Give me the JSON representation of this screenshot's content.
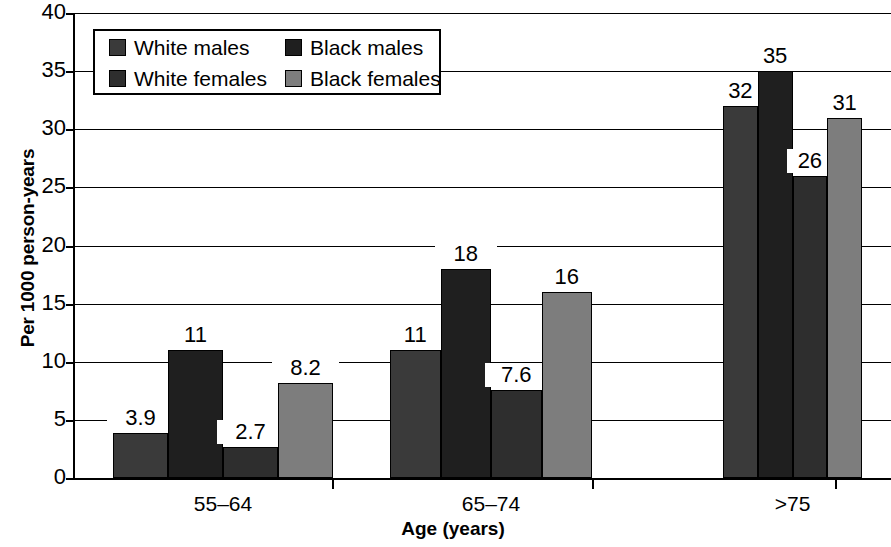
{
  "chart_data": {
    "type": "bar",
    "title": "",
    "subtitle": "",
    "xlabel": "Age (years)",
    "ylabel": "Per 1000 person-years",
    "categories": [
      "55–64",
      "65–74",
      ">75"
    ],
    "series": [
      {
        "name": "White males",
        "color": "#3a3a3a",
        "values": [
          3.9,
          11,
          32
        ],
        "labels": [
          "3.9",
          "11",
          "32"
        ]
      },
      {
        "name": "Black males",
        "color": "#1f1f1f",
        "values": [
          11,
          18,
          35
        ],
        "labels": [
          "11",
          "18",
          "35"
        ]
      },
      {
        "name": "White females",
        "color": "#2e2e2e",
        "values": [
          2.7,
          7.6,
          26
        ],
        "labels": [
          "2.7",
          "7.6",
          "26"
        ]
      },
      {
        "name": "Black females",
        "color": "#7d7d7d",
        "values": [
          8.2,
          16,
          31
        ],
        "labels": [
          "8.2",
          "16",
          "31"
        ]
      }
    ],
    "ylim": [
      0,
      40
    ],
    "yticks": [
      "0",
      "5",
      "10",
      "15",
      "20",
      "25",
      "30",
      "35",
      "40"
    ],
    "ytick_values": [
      0,
      5,
      10,
      15,
      20,
      25,
      30,
      35,
      40
    ],
    "grid": true,
    "grid_axis": "y",
    "legend_position": "top-left-inside",
    "bar_outline_color": "#000000",
    "background_color": "#ffffff"
  },
  "legend": {
    "entries": [
      {
        "label": "White males"
      },
      {
        "label": "Black males"
      },
      {
        "label": "White females"
      },
      {
        "label": "Black females"
      }
    ]
  },
  "axes": {
    "x_title": "Age (years)",
    "y_title": "Per 1000 person-years"
  }
}
